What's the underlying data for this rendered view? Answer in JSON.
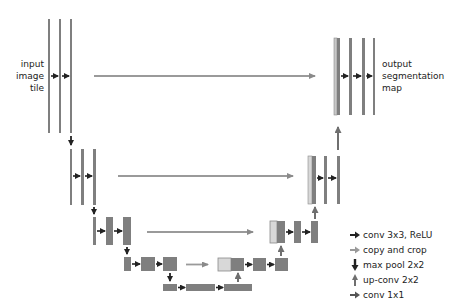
{
  "labels": {
    "input": [
      "input",
      "image",
      "tile"
    ],
    "output": [
      "output",
      "segmentation",
      "map"
    ]
  },
  "legend": [
    {
      "icon": "conv-arrow-icon",
      "label": "conv 3x3, ReLU",
      "color": "#222222"
    },
    {
      "icon": "copy-arrow-icon",
      "label": "copy and crop",
      "color": "#9a9a9a"
    },
    {
      "icon": "maxpool-arrow-icon",
      "label": "max pool 2x2",
      "color": "#222222"
    },
    {
      "icon": "upconv-arrow-icon",
      "label": "up-conv 2x2",
      "color": "#6f6f6f"
    },
    {
      "icon": "conv1x1-arrow-icon",
      "label": "conv 1x1",
      "color": "#555555"
    }
  ],
  "colors": {
    "feature_map": "#7f7f7f",
    "feature_map_light": "#d8d8d8",
    "conv_arrow": "#222222",
    "copy_arrow": "#9a9a9a",
    "upconv_arrow": "#6f6f6f"
  }
}
